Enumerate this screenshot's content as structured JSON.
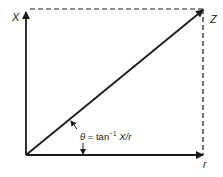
{
  "diagram": {
    "labels": {
      "vertical_axis": "X",
      "hypotenuse": "Z",
      "horizontal_axis": "r"
    },
    "angle_annotation": {
      "symbol": "θ",
      "equals": " = tan",
      "superscript": "−1",
      "ratio": " X/r"
    },
    "colors": {
      "line": "#1a1a1a",
      "background": "#ffffff"
    }
  }
}
